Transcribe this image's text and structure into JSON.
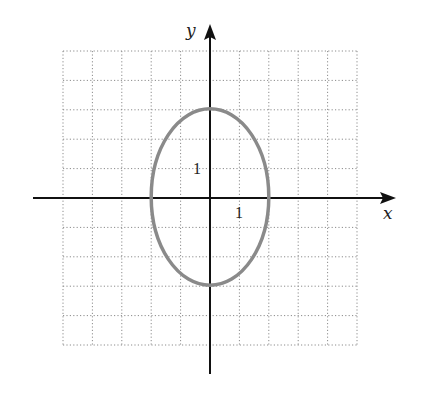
{
  "chart_data": {
    "type": "line",
    "title": "",
    "xlabel": "x",
    "ylabel": "y",
    "xlim": [
      -5,
      5
    ],
    "ylim": [
      -5,
      5
    ],
    "grid": true,
    "grid_style": "dotted",
    "tick_labels": [
      {
        "axis": "x",
        "value": 1,
        "label": "1"
      },
      {
        "axis": "y",
        "value": 1,
        "label": "1"
      }
    ],
    "series": [
      {
        "name": "ellipse",
        "shape": "ellipse",
        "center": [
          0,
          0
        ],
        "semi_axis_x": 2,
        "semi_axis_y": 3,
        "equation": "x^2/4 + y^2/9 = 1",
        "color": "#8a8a8a"
      }
    ]
  },
  "labels": {
    "x_axis": "x",
    "y_axis": "y",
    "x_tick": "1",
    "y_tick": "1"
  },
  "colors": {
    "axis": "#111111",
    "grid": "#8c8c8c",
    "curve": "#8a8a8a"
  }
}
